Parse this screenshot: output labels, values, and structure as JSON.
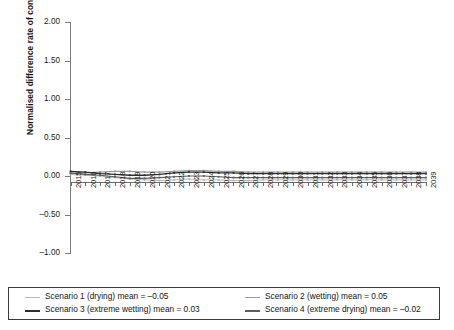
{
  "chart_data": {
    "type": "line",
    "title": "",
    "xlabel": "",
    "ylabel": "Normalised difference rate of content migration",
    "ylim": [
      -1.0,
      2.0
    ],
    "ytick_labels": [
      "2.00",
      "1.50",
      "1.00",
      "0.50",
      "0.00",
      "-0.50",
      "-1.00"
    ],
    "ytick_values": [
      2.0,
      1.5,
      1.0,
      0.5,
      0.0,
      -0.5,
      -1.0
    ],
    "grid": false,
    "legend_position": "bottom",
    "x": [
      2015,
      2016,
      2017,
      2018,
      2019,
      2020,
      2021,
      2022,
      2023,
      2024,
      2025,
      2026,
      2027,
      2028,
      2029,
      2030,
      2031,
      2032,
      2033,
      2034,
      2035,
      2036,
      2037,
      2038,
      2039
    ],
    "categories": [
      "2015",
      "2016",
      "2017",
      "2018",
      "2019",
      "2020",
      "2021",
      "2022",
      "2023",
      "2024",
      "2025",
      "2026",
      "2027",
      "2028",
      "2029",
      "2030",
      "2031",
      "2032",
      "2033",
      "2034",
      "2035",
      "2036",
      "2037",
      "2038",
      "2039"
    ],
    "series": [
      {
        "name": "Scenario 1 (drying)",
        "mean": -0.05,
        "color": "#b8b8b8",
        "width": 1.0,
        "values": [
          0.02,
          0.01,
          0.0,
          -0.02,
          -0.04,
          -0.05,
          -0.06,
          -0.05,
          -0.04,
          -0.05,
          -0.05,
          -0.06,
          -0.06,
          -0.05,
          -0.05,
          -0.05,
          -0.05,
          -0.05,
          -0.05,
          -0.05,
          -0.05,
          -0.05,
          -0.05,
          -0.05,
          -0.05
        ]
      },
      {
        "name": "Scenario 2 (wetting)",
        "mean": 0.05,
        "color": "#9a9a9a",
        "width": 1.1,
        "values": [
          0.03,
          0.04,
          0.05,
          0.06,
          0.06,
          0.05,
          0.05,
          0.06,
          0.07,
          0.07,
          0.06,
          0.06,
          0.05,
          0.05,
          0.05,
          0.05,
          0.05,
          0.05,
          0.05,
          0.05,
          0.05,
          0.05,
          0.05,
          0.05,
          0.05
        ]
      },
      {
        "name": "Scenario 3 (extreme wetting)",
        "mean": 0.03,
        "color": "#2e2e2e",
        "width": 1.3,
        "values": [
          0.06,
          0.05,
          0.03,
          0.02,
          0.01,
          0.01,
          0.02,
          0.04,
          0.05,
          0.05,
          0.04,
          0.04,
          0.03,
          0.03,
          0.03,
          0.03,
          0.03,
          0.03,
          0.03,
          0.03,
          0.03,
          0.03,
          0.03,
          0.03,
          0.03
        ]
      },
      {
        "name": "Scenario 4 (extreme drying)",
        "mean": -0.02,
        "color": "#5c5c5c",
        "width": 1.2,
        "values": [
          0.04,
          0.02,
          0.01,
          -0.01,
          -0.03,
          -0.03,
          -0.02,
          -0.01,
          0.0,
          0.0,
          -0.01,
          -0.02,
          -0.02,
          -0.02,
          -0.02,
          -0.02,
          -0.02,
          -0.02,
          -0.02,
          -0.02,
          -0.02,
          -0.02,
          -0.02,
          -0.02,
          -0.02
        ]
      }
    ]
  },
  "legend": {
    "entries": [
      {
        "label": "Scenario 1 (drying) mean = –0.05",
        "color": "#b8b8b8",
        "width": "1px"
      },
      {
        "label": "Scenario 3 (extreme wetting) mean = 0.03",
        "color": "#2e2e2e",
        "width": "2px"
      },
      {
        "label": "Scenario 2 (wetting) mean = 0.05",
        "color": "#9a9a9a",
        "width": "1px"
      },
      {
        "label": "Scenario 4 (extreme drying) mean = –0.02",
        "color": "#5c5c5c",
        "width": "2px"
      }
    ]
  }
}
